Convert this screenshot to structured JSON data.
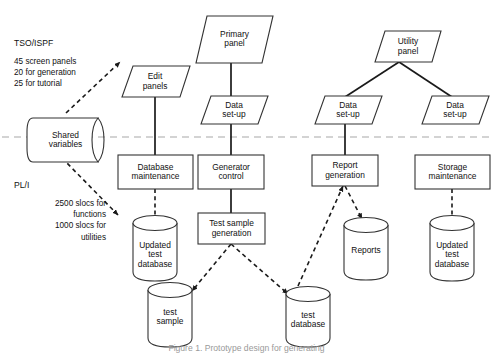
{
  "figure": {
    "caption": "Figure 1. Prototype design for generating",
    "boundary_label": "TSO/ISPF – PL/I boundary"
  },
  "annotations": [
    {
      "name": "tso-ispf",
      "header": "TSO/ISPF",
      "lines": [
        "45 screen panels",
        "20 for generation",
        "25 for tutorial"
      ],
      "align": "left"
    },
    {
      "name": "pl-i",
      "header": "PL/I",
      "lines": [
        "2500 slocs for",
        "functions",
        "1000 slocs for",
        "utilities"
      ],
      "align": "right"
    }
  ],
  "nodes": {
    "shared_variables": {
      "label": "Shared\nvariables",
      "shape": "data-store"
    },
    "primary_panel": {
      "label": "Primary\npanel",
      "shape": "parallelogram"
    },
    "edit_panels": {
      "label": "Edit\npanels",
      "shape": "parallelogram"
    },
    "utility_panel": {
      "label": "Utility\npanel",
      "shape": "parallelogram"
    },
    "data_setup_1": {
      "label": "Data\nset-up",
      "shape": "parallelogram"
    },
    "data_setup_2": {
      "label": "Data\nset-up",
      "shape": "parallelogram"
    },
    "data_setup_3": {
      "label": "Data\nset-up",
      "shape": "parallelogram"
    },
    "database_maintenance": {
      "label": "Database\nmaintenance",
      "shape": "rectangle"
    },
    "generator_control": {
      "label": "Generator\ncontrol",
      "shape": "rectangle"
    },
    "report_generation": {
      "label": "Report\ngeneration",
      "shape": "rectangle"
    },
    "storage_maintenance": {
      "label": "Storage\nmaintenance",
      "shape": "rectangle"
    },
    "test_sample_generation": {
      "label": "Test sample\ngeneration",
      "shape": "rectangle"
    },
    "updated_test_database_left": {
      "label": "Updated\ntest\ndatabase",
      "shape": "cylinder"
    },
    "updated_test_database_right": {
      "label": "Updated\ntest\ndatabase",
      "shape": "cylinder"
    },
    "reports": {
      "label": "Reports",
      "shape": "cylinder"
    },
    "test_sample": {
      "label": "test\nsample",
      "shape": "cylinder"
    },
    "test_database": {
      "label": "test\ndatabase",
      "shape": "cylinder"
    }
  },
  "colors": {
    "stroke": "#333333",
    "thick_stroke": "#1a1a1a",
    "boundary": "#a8a8a8",
    "text": "#111111",
    "background": "#ffffff",
    "caption": "#9a9a9a"
  }
}
